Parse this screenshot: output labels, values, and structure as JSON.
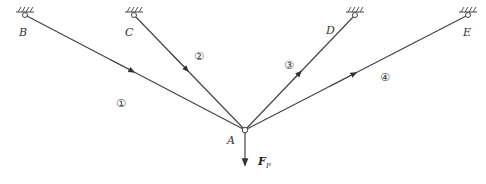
{
  "diagram": {
    "type": "pin-jointed truss, concurrent bars at node A",
    "colors": {
      "line": "#444444",
      "background": "#ffffff"
    },
    "node": {
      "label": "A",
      "x": 245,
      "y": 130
    },
    "supports": [
      {
        "label": "B",
        "x": 25,
        "y": 15
      },
      {
        "label": "C",
        "x": 134,
        "y": 15
      },
      {
        "label": "D",
        "x": 355,
        "y": 15
      },
      {
        "label": "E",
        "x": 468,
        "y": 15
      }
    ],
    "bars": [
      {
        "id": "1",
        "label": "①",
        "from": "B",
        "to": "A",
        "arrow": "toward A"
      },
      {
        "id": "2",
        "label": "②",
        "from": "C",
        "to": "A",
        "arrow": "toward A"
      },
      {
        "id": "3",
        "label": "③",
        "from": "A",
        "to": "D",
        "arrow": "away from A"
      },
      {
        "id": "4",
        "label": "④",
        "from": "A",
        "to": "E",
        "arrow": "away from A"
      }
    ],
    "force": {
      "label": "F",
      "subscript": "P",
      "direction": "down"
    }
  }
}
